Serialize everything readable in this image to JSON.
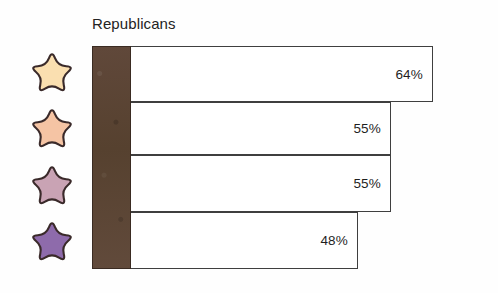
{
  "chart_data": {
    "type": "bar",
    "orientation": "horizontal",
    "title": "Republicans",
    "xlabel": "",
    "ylabel": "",
    "categories": [
      "",
      "",
      "",
      ""
    ],
    "values": [
      64,
      55,
      55,
      48
    ],
    "value_labels": [
      "64%",
      "55%",
      "55%",
      "48%"
    ],
    "xlim": [
      0,
      100
    ],
    "grid": false,
    "legend": "none",
    "series": [
      {
        "name": "Republicans",
        "values": [
          64,
          55,
          55,
          48
        ]
      }
    ],
    "bars": [
      {
        "label": "64%",
        "value": 64,
        "marker_color": "#fadfb0",
        "marker_name": "star-icon-cream"
      },
      {
        "label": "55%",
        "value": 55,
        "marker_color": "#f5c4a4",
        "marker_name": "star-icon-peach"
      },
      {
        "label": "55%",
        "value": 55,
        "marker_color": "#c9a3b4",
        "marker_name": "star-icon-mauve"
      },
      {
        "label": "48%",
        "value": 48,
        "marker_color": "#8e6bab",
        "marker_name": "star-icon-purple"
      }
    ]
  },
  "colors": {
    "axis_band": "#5b4436",
    "bar_outline": "#3f3f3f",
    "bar_fill": "#ffffff",
    "background": "#fefefe",
    "text": "#232323",
    "star_outline": "#3a2a2a",
    "star_1": "#fadfb0",
    "star_2": "#f5c4a4",
    "star_3": "#c9a3b4",
    "star_4": "#8e6bab"
  },
  "legend_icons": [
    {
      "name": "star-icon-cream",
      "color": "#fadfb0"
    },
    {
      "name": "star-icon-peach",
      "color": "#f5c4a4"
    },
    {
      "name": "star-icon-mauve",
      "color": "#c9a3b4"
    },
    {
      "name": "star-icon-purple",
      "color": "#8e6bab"
    }
  ]
}
